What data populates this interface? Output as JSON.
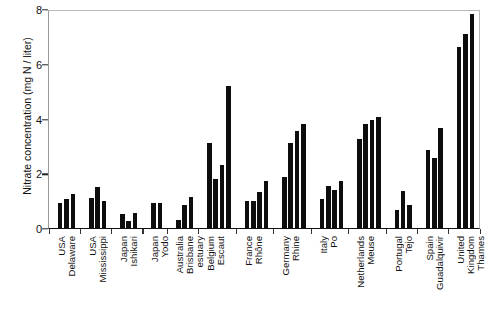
{
  "chart_data": {
    "type": "bar",
    "title": "",
    "xlabel": "",
    "ylabel": "Nitrate concentration (mg N / liter)",
    "ylim": [
      0,
      8
    ],
    "yticks": [
      0,
      2,
      4,
      6,
      8
    ],
    "ytick_labels": [
      "0",
      "2",
      "4",
      "6",
      "8"
    ],
    "grid": false,
    "legend": "none",
    "categories": [
      "USA Delaware",
      "USA Mississippi",
      "Japan Ishikari",
      "Japan Yodo",
      "Australia Brisbane estuary",
      "Belgium Escaut",
      "France Rhône",
      "Germany Rhine",
      "Italy Po",
      "Netherlands Meuse",
      "Portugal Tejo",
      "Spain Guadalquivir",
      "United Kingdom Thames"
    ],
    "groups": [
      {
        "label_lines": [
          "USA",
          "Delaware"
        ],
        "values": [
          0.9,
          1.05,
          1.25
        ]
      },
      {
        "label_lines": [
          "USA",
          "Mississippi"
        ],
        "values": [
          1.1,
          1.5,
          1.0
        ]
      },
      {
        "label_lines": [
          "Japan",
          "Ishikari"
        ],
        "values": [
          0.5,
          0.25,
          0.55
        ]
      },
      {
        "label_lines": [
          "Japan",
          "Yodo"
        ],
        "values": [
          0.9,
          0.9
        ]
      },
      {
        "label_lines": [
          "Australia",
          "Brisbane",
          "estuary"
        ],
        "values": [
          0.3,
          0.85,
          1.15
        ]
      },
      {
        "label_lines": [
          "Belgium",
          "Escaut"
        ],
        "values": [
          3.1,
          1.8,
          2.3,
          5.2
        ]
      },
      {
        "label_lines": [
          "France",
          "Rhône"
        ],
        "values": [
          1.0,
          1.0,
          1.3,
          1.7
        ]
      },
      {
        "label_lines": [
          "Germany",
          "Rhine"
        ],
        "values": [
          1.85,
          3.1,
          3.55,
          3.8
        ]
      },
      {
        "label_lines": [
          "Italy",
          "Po"
        ],
        "values": [
          1.05,
          1.55,
          1.4,
          1.7
        ]
      },
      {
        "label_lines": [
          "Netherlands",
          "Meuse"
        ],
        "values": [
          3.25,
          3.8,
          3.95,
          4.05
        ]
      },
      {
        "label_lines": [
          "Portugal",
          "Tejo"
        ],
        "values": [
          0.65,
          1.35,
          0.85
        ]
      },
      {
        "label_lines": [
          "Spain",
          "Guadalquivir"
        ],
        "values": [
          2.85,
          2.55,
          3.65
        ]
      },
      {
        "label_lines": [
          "United",
          "Kingdom",
          "Thames"
        ],
        "values": [
          6.6,
          7.1,
          7.8
        ]
      }
    ]
  }
}
